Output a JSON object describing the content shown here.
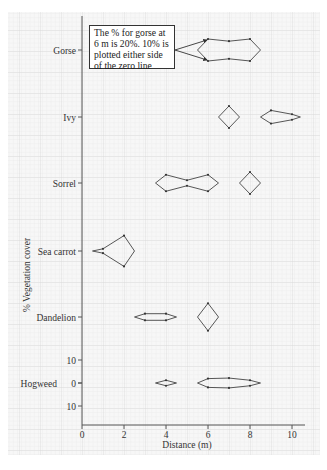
{
  "chart_data": {
    "type": "kite",
    "title": "",
    "xlabel": "Distance (m)",
    "ylabel": "% Vegetation cover",
    "xlim": [
      0,
      10
    ],
    "x_ticks": [
      0,
      2,
      4,
      6,
      8,
      10
    ],
    "y_scale_ticks": {
      "species": "Hogweed",
      "labels": [
        "10",
        "0",
        "10"
      ]
    },
    "grid": true,
    "annotation": "The % for gorse at 6 m is 20%. 10% is plotted either side of the zero line",
    "series": [
      {
        "name": "Gorse",
        "shapes": [
          {
            "left_apex": 5.5,
            "right_apex": 8.5,
            "points": [
              {
                "x": 6,
                "value": 20
              },
              {
                "x": 7,
                "value": 16
              },
              {
                "x": 8,
                "value": 20
              }
            ]
          }
        ]
      },
      {
        "name": "Ivy",
        "shapes": [
          {
            "left_apex": 6.5,
            "right_apex": 7.5,
            "points": [
              {
                "x": 7,
                "value": 20
              }
            ]
          },
          {
            "left_apex": 8.5,
            "right_apex": 10.4,
            "points": [
              {
                "x": 9,
                "value": 12
              },
              {
                "x": 10,
                "value": 5
              }
            ]
          }
        ]
      },
      {
        "name": "Sorrel",
        "shapes": [
          {
            "left_apex": 3.5,
            "right_apex": 6.5,
            "points": [
              {
                "x": 4,
                "value": 15
              },
              {
                "x": 5,
                "value": 5
              },
              {
                "x": 6,
                "value": 15
              }
            ]
          },
          {
            "left_apex": 7.5,
            "right_apex": 8.5,
            "points": [
              {
                "x": 8,
                "value": 20
              }
            ]
          }
        ]
      },
      {
        "name": "Sea carrot",
        "shapes": [
          {
            "left_apex": 0.5,
            "right_apex": 2.5,
            "points": [
              {
                "x": 1,
                "value": 4
              },
              {
                "x": 2,
                "value": 28
              }
            ]
          }
        ]
      },
      {
        "name": "Dandelion",
        "shapes": [
          {
            "left_apex": 2.5,
            "right_apex": 4.5,
            "points": [
              {
                "x": 3,
                "value": 6
              },
              {
                "x": 4,
                "value": 6
              }
            ]
          },
          {
            "left_apex": 5.5,
            "right_apex": 6.5,
            "points": [
              {
                "x": 6,
                "value": 25
              }
            ]
          }
        ]
      },
      {
        "name": "Hogweed",
        "shapes": [
          {
            "left_apex": 3.5,
            "right_apex": 4.5,
            "points": [
              {
                "x": 4,
                "value": 5
              }
            ]
          },
          {
            "left_apex": 5.5,
            "right_apex": 8.5,
            "points": [
              {
                "x": 6,
                "value": 8
              },
              {
                "x": 7,
                "value": 9
              },
              {
                "x": 8,
                "value": 5
              }
            ]
          }
        ]
      }
    ]
  }
}
